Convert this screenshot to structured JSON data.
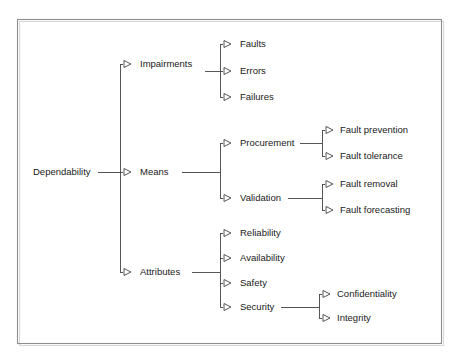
{
  "figure": {
    "kind": "tree-diagram",
    "title_text": "",
    "background_color": "#ffffff",
    "border_color": "#8e8e8e",
    "line_color": "#444444",
    "text_color": "#1a1a1a",
    "arrow_glyph": "open-triangle-right"
  },
  "tree": {
    "root": {
      "label": "Dependability",
      "x": 33,
      "y": 172
    },
    "level1": [
      {
        "label": "Impairments",
        "x": 140,
        "y": 64
      },
      {
        "label": "Means",
        "x": 140,
        "y": 172
      },
      {
        "label": "Attributes",
        "x": 140,
        "y": 272
      }
    ],
    "level2": [
      {
        "label": "Faults",
        "x": 240,
        "y": 44,
        "parent": "Impairments"
      },
      {
        "label": "Errors",
        "x": 240,
        "y": 71,
        "parent": "Impairments"
      },
      {
        "label": "Failures",
        "x": 240,
        "y": 97,
        "parent": "Impairments"
      },
      {
        "label": "Procurement",
        "x": 240,
        "y": 143,
        "parent": "Means"
      },
      {
        "label": "Validation",
        "x": 240,
        "y": 198,
        "parent": "Means"
      },
      {
        "label": "Reliability",
        "x": 240,
        "y": 233,
        "parent": "Attributes"
      },
      {
        "label": "Availability",
        "x": 240,
        "y": 258,
        "parent": "Attributes"
      },
      {
        "label": "Safety",
        "x": 240,
        "y": 283,
        "parent": "Attributes"
      },
      {
        "label": "Security",
        "x": 240,
        "y": 307,
        "parent": "Attributes"
      }
    ],
    "level3": [
      {
        "label": "Fault prevention",
        "x": 340,
        "y": 130,
        "parent": "Procurement"
      },
      {
        "label": "Fault tolerance",
        "x": 340,
        "y": 156,
        "parent": "Procurement"
      },
      {
        "label": "Fault removal",
        "x": 340,
        "y": 184,
        "parent": "Validation"
      },
      {
        "label": "Fault forecasting",
        "x": 340,
        "y": 210,
        "parent": "Validation"
      },
      {
        "label": "Confidentiality",
        "x": 337,
        "y": 294,
        "parent": "Security"
      },
      {
        "label": "Integrity",
        "x": 337,
        "y": 318,
        "parent": "Security"
      }
    ]
  }
}
